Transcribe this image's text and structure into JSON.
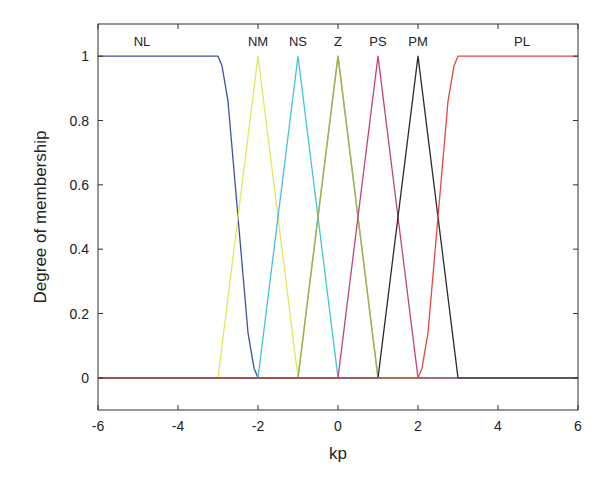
{
  "chart_data": {
    "type": "line",
    "title": "",
    "xlabel": "kp",
    "ylabel": "Degree of membership",
    "xlim": [
      -6,
      6
    ],
    "ylim": [
      -0.1,
      1.1
    ],
    "xticks": [
      -6,
      -4,
      -2,
      0,
      2,
      4,
      6
    ],
    "xtick_labels": [
      "-6",
      "-4",
      "-2",
      "0",
      "2",
      "4",
      "6"
    ],
    "yticks": [
      0,
      0.2,
      0.4,
      0.6,
      0.8,
      1
    ],
    "ytick_labels": [
      "0",
      "0.2",
      "0.4",
      "0.6",
      "0.8",
      "1"
    ],
    "grid": false,
    "legend": "none (labels placed above peaks)",
    "series": [
      {
        "name": "NL",
        "shape": "z-shaped",
        "color": "#3f4fa8",
        "label_x": -4.9,
        "x": [
          -6,
          -3.0,
          -2.9,
          -2.75,
          -2.5,
          -2.25,
          -2.1,
          -2.0,
          6
        ],
        "y": [
          1,
          1,
          0.97,
          0.86,
          0.5,
          0.14,
          0.03,
          0,
          0
        ]
      },
      {
        "name": "NM",
        "shape": "triangle",
        "color": "#e6e65a",
        "label_x": -2,
        "x": [
          -6,
          -3,
          -2,
          -1,
          6
        ],
        "y": [
          0,
          0,
          1,
          0,
          0
        ]
      },
      {
        "name": "NS",
        "shape": "triangle",
        "color": "#3fc6d8",
        "label_x": -1,
        "x": [
          -6,
          -2,
          -1,
          0,
          6
        ],
        "y": [
          0,
          0,
          1,
          0,
          0
        ]
      },
      {
        "name": "Z",
        "shape": "triangle",
        "color": "#3c6e3c",
        "label_x": 0,
        "x": [
          -6,
          -1,
          0,
          1,
          6
        ],
        "y": [
          0,
          0,
          1,
          0,
          0
        ]
      },
      {
        "name": "Z-overlay",
        "shape": "triangle",
        "color": "#e6e65a",
        "label_x": null,
        "x": [
          -6,
          -1,
          0,
          1,
          2,
          6
        ],
        "y": [
          0,
          0,
          1,
          0,
          0,
          0
        ]
      },
      {
        "name": "PS",
        "shape": "triangle",
        "color": "#c0437e",
        "label_x": 1,
        "x": [
          -6,
          0,
          1,
          2,
          6
        ],
        "y": [
          0,
          0,
          1,
          0,
          0
        ]
      },
      {
        "name": "PM",
        "shape": "triangle",
        "color": "#2b2b2b",
        "label_x": 2,
        "x": [
          -6,
          1,
          2,
          3,
          6
        ],
        "y": [
          0,
          0,
          1,
          0,
          0
        ]
      },
      {
        "name": "PL",
        "shape": "s-shaped",
        "color": "#e8463c",
        "label_x": 4.6,
        "x": [
          -6,
          2.0,
          2.1,
          2.25,
          2.5,
          2.75,
          2.9,
          3.0,
          6
        ],
        "y": [
          0,
          0,
          0.03,
          0.14,
          0.5,
          0.86,
          0.97,
          1,
          1
        ]
      }
    ]
  }
}
